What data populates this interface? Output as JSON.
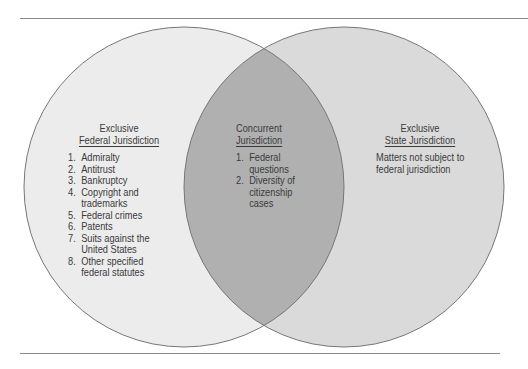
{
  "diagram": {
    "type": "venn",
    "colors": {
      "left_fill": "#ececec",
      "right_fill": "#dadada",
      "overlap_fill": "#b0b0b0",
      "outline": "#777777",
      "rule": "#8a8a8a"
    },
    "left": {
      "title_line1": "Exclusive",
      "title_line2": "Federal Jurisdiction",
      "items": [
        {
          "num": "1.",
          "text": "Admiralty"
        },
        {
          "num": "2.",
          "text": "Antitrust"
        },
        {
          "num": "3.",
          "text": "Bankruptcy"
        },
        {
          "num": "4.",
          "text": "Copyright and trademarks"
        },
        {
          "num": "5.",
          "text": "Federal crimes"
        },
        {
          "num": "6.",
          "text": "Patents"
        },
        {
          "num": "7.",
          "text": "Suits against the United States"
        },
        {
          "num": "8.",
          "text": "Other specified federal statutes"
        }
      ]
    },
    "overlap": {
      "title_line1": "Concurrent",
      "title_line2": "Jurisdiction",
      "items": [
        {
          "num": "1.",
          "text": "Federal questions"
        },
        {
          "num": "2.",
          "text": "Diversity of citizenship cases"
        }
      ]
    },
    "right": {
      "title_line1": "Exclusive",
      "title_line2": "State Jurisdiction",
      "text": "Matters not subject to federal jurisdiction"
    }
  }
}
